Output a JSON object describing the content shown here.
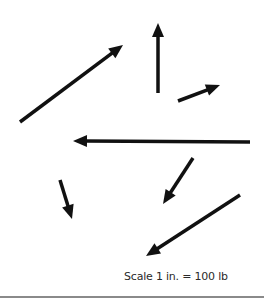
{
  "diagram": {
    "type": "force-vectors",
    "colors": {
      "arrow": "#111111",
      "rule": "#8a8a8a",
      "text": "#2a2a2a"
    },
    "arrows": [
      {
        "id": "A",
        "tail": [
          20,
          122
        ],
        "head": [
          123,
          45
        ]
      },
      {
        "id": "B",
        "tail": [
          158,
          93
        ],
        "head": [
          158,
          23
        ]
      },
      {
        "id": "C",
        "tail": [
          178,
          101
        ],
        "head": [
          220,
          85
        ]
      },
      {
        "id": "D",
        "tail": [
          250,
          142
        ],
        "head": [
          73,
          141
        ]
      },
      {
        "id": "E",
        "tail": [
          60,
          180
        ],
        "head": [
          72,
          219
        ]
      },
      {
        "id": "F",
        "tail": [
          193,
          158
        ],
        "head": [
          163,
          204
        ]
      },
      {
        "id": "G",
        "tail": [
          240,
          195
        ],
        "head": [
          146,
          256
        ]
      }
    ],
    "scale_label": "Scale 1 in. = 100 lb"
  }
}
